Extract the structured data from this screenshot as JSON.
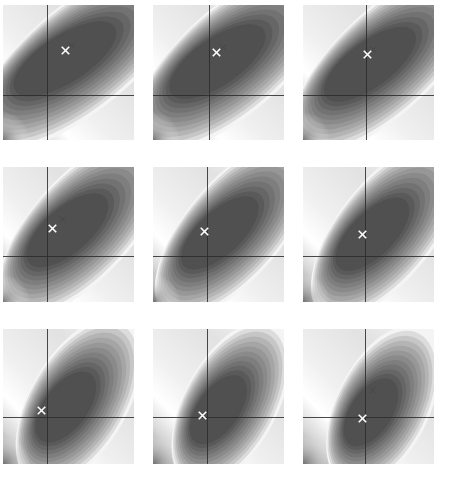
{
  "figure": {
    "title": "",
    "layout": "3x3 grid of filled contour plots",
    "background_color": "#ffffff",
    "colormap": "grayscale",
    "rows": 3,
    "cols": 3,
    "panel_width": 131,
    "panel_height": 135,
    "panel_gap_x": 19,
    "panel_gap_y": 27,
    "origin_x": 3,
    "origin_y": 5
  },
  "chart_data": {
    "type": "heatmap",
    "title": "",
    "xlabel": "",
    "ylabel": "",
    "colormap": "gray",
    "levels": 12,
    "level_colors": [
      "#505050",
      "#5a5a5a",
      "#666666",
      "#727272",
      "#7e7e7e",
      "#8a8a8a",
      "#979797",
      "#a5a5a5",
      "#b4b4b4",
      "#c6c6c6",
      "#dcdcdc",
      "#f4f4f4"
    ],
    "axis_color": "#2a2a2a",
    "marker_color": "#ffffff",
    "ghost_marker_color": "#3c3c3c",
    "xlim": [
      -2.0,
      2.0
    ],
    "ylim": [
      -1.0,
      3.0
    ],
    "panels": [
      {
        "index": 1,
        "row": 1,
        "col": 1,
        "axis_x_frac": 0.335,
        "axis_y_frac": 0.665,
        "valley_cx_frac": 0.46,
        "valley_cy_frac": 0.4,
        "valley_rx_frac": 0.4,
        "valley_ry_frac": 0.25,
        "valley_rot_deg": -32,
        "marker_x_frac": 0.475,
        "marker_y_frac": 0.335,
        "ghost_x_frac": 0.52,
        "ghost_y_frac": 0.3,
        "has_ghost": true
      },
      {
        "index": 2,
        "row": 1,
        "col": 2,
        "axis_x_frac": 0.425,
        "axis_y_frac": 0.665,
        "valley_cx_frac": 0.48,
        "valley_cy_frac": 0.42,
        "valley_rx_frac": 0.38,
        "valley_ry_frac": 0.25,
        "valley_rot_deg": -34,
        "marker_x_frac": 0.485,
        "marker_y_frac": 0.35,
        "ghost_x_frac": 0.535,
        "ghost_y_frac": 0.315,
        "has_ghost": true
      },
      {
        "index": 3,
        "row": 1,
        "col": 3,
        "axis_x_frac": 0.48,
        "axis_y_frac": 0.665,
        "valley_cx_frac": 0.5,
        "valley_cy_frac": 0.44,
        "valley_rx_frac": 0.37,
        "valley_ry_frac": 0.24,
        "valley_rot_deg": -36,
        "marker_x_frac": 0.49,
        "marker_y_frac": 0.365,
        "ghost_x_frac": 0.54,
        "ghost_y_frac": 0.33,
        "has_ghost": true
      },
      {
        "index": 4,
        "row": 2,
        "col": 1,
        "axis_x_frac": 0.335,
        "axis_y_frac": 0.66,
        "valley_cx_frac": 0.48,
        "valley_cy_frac": 0.47,
        "valley_rx_frac": 0.34,
        "valley_ry_frac": 0.24,
        "valley_rot_deg": -40,
        "marker_x_frac": 0.375,
        "marker_y_frac": 0.455,
        "ghost_x_frac": 0.455,
        "ghost_y_frac": 0.385,
        "has_ghost": true
      },
      {
        "index": 5,
        "row": 2,
        "col": 2,
        "axis_x_frac": 0.415,
        "axis_y_frac": 0.66,
        "valley_cx_frac": 0.5,
        "valley_cy_frac": 0.49,
        "valley_rx_frac": 0.33,
        "valley_ry_frac": 0.23,
        "valley_rot_deg": -42,
        "marker_x_frac": 0.395,
        "marker_y_frac": 0.48,
        "ghost_x_frac": 0.395,
        "ghost_y_frac": 0.48,
        "has_ghost": false
      },
      {
        "index": 6,
        "row": 2,
        "col": 3,
        "axis_x_frac": 0.475,
        "axis_y_frac": 0.66,
        "valley_cx_frac": 0.52,
        "valley_cy_frac": 0.5,
        "valley_rx_frac": 0.32,
        "valley_ry_frac": 0.23,
        "valley_rot_deg": -44,
        "marker_x_frac": 0.45,
        "marker_y_frac": 0.5,
        "ghost_x_frac": 0.45,
        "ghost_y_frac": 0.5,
        "has_ghost": false
      },
      {
        "index": 7,
        "row": 3,
        "col": 1,
        "axis_x_frac": 0.335,
        "axis_y_frac": 0.655,
        "valley_cx_frac": 0.47,
        "valley_cy_frac": 0.58,
        "valley_rx_frac": 0.28,
        "valley_ry_frac": 0.23,
        "valley_rot_deg": -52,
        "marker_x_frac": 0.29,
        "marker_y_frac": 0.6,
        "ghost_x_frac": 0.29,
        "ghost_y_frac": 0.6,
        "has_ghost": false
      },
      {
        "index": 8,
        "row": 3,
        "col": 2,
        "axis_x_frac": 0.415,
        "axis_y_frac": 0.655,
        "valley_cx_frac": 0.49,
        "valley_cy_frac": 0.6,
        "valley_rx_frac": 0.27,
        "valley_ry_frac": 0.22,
        "valley_rot_deg": -54,
        "marker_x_frac": 0.38,
        "marker_y_frac": 0.64,
        "ghost_x_frac": 0.38,
        "ghost_y_frac": 0.64,
        "has_ghost": false
      },
      {
        "index": 9,
        "row": 3,
        "col": 3,
        "axis_x_frac": 0.47,
        "axis_y_frac": 0.655,
        "valley_cx_frac": 0.51,
        "valley_cy_frac": 0.62,
        "valley_rx_frac": 0.26,
        "valley_ry_frac": 0.22,
        "valley_rot_deg": -56,
        "marker_x_frac": 0.455,
        "marker_y_frac": 0.66,
        "ghost_x_frac": 0.53,
        "ghost_y_frac": 0.455,
        "has_ghost": true
      }
    ]
  }
}
